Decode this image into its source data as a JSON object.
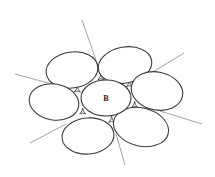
{
  "diagram": {
    "title": "",
    "center_label": "B",
    "stroke_color": "#3a3a3a",
    "line_color": "#8a8a8a",
    "background": "#ffffff",
    "center_cell": {
      "cx": 106,
      "cy": 98,
      "rx": 25,
      "ry": 18,
      "label": "B"
    },
    "surrounding_cells": [
      {
        "name": "top-left",
        "cx": 72,
        "cy": 70,
        "rx": 26,
        "ry": 18,
        "rotate": -8
      },
      {
        "name": "top-right",
        "cx": 125,
        "cy": 65,
        "rx": 27,
        "ry": 18,
        "rotate": -10
      },
      {
        "name": "right",
        "cx": 157,
        "cy": 91,
        "rx": 26,
        "ry": 19,
        "rotate": 12
      },
      {
        "name": "bottom-right",
        "cx": 141,
        "cy": 127,
        "rx": 28,
        "ry": 19,
        "rotate": 14
      },
      {
        "name": "bottom-left",
        "cx": 88,
        "cy": 136,
        "rx": 26,
        "ry": 18,
        "rotate": -5
      },
      {
        "name": "left",
        "cx": 54,
        "cy": 102,
        "rx": 25,
        "ry": 18,
        "rotate": 10
      }
    ],
    "radial_lines": [
      {
        "x1": 82,
        "y1": 20,
        "x2": 98,
        "y2": 66
      },
      {
        "x1": 184,
        "y1": 53,
        "x2": 148,
        "y2": 75
      },
      {
        "x1": 202,
        "y1": 124,
        "x2": 160,
        "y2": 111
      },
      {
        "x1": 125,
        "y1": 165,
        "x2": 116,
        "y2": 134
      },
      {
        "x1": 30,
        "y1": 143,
        "x2": 66,
        "y2": 124
      },
      {
        "x1": 15,
        "y1": 74,
        "x2": 52,
        "y2": 84
      }
    ]
  }
}
